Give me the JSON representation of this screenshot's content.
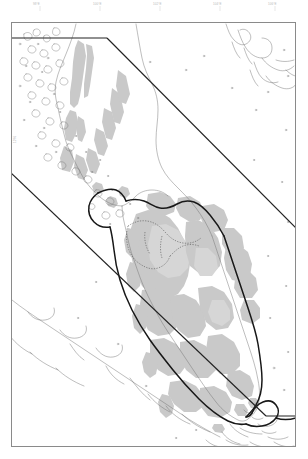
{
  "map": {
    "title": "Malay Peninsula Study Area Map",
    "region_name": "Malay Peninsula",
    "background_color": "#ffffff",
    "frame": {
      "border_color": "#8a8a8a",
      "x": 11,
      "y": 22,
      "width": 285,
      "height": 425
    },
    "legend_note": "",
    "graticule_color": "#c9c9c9",
    "top_tick_labels": [
      "98°E",
      "100°E",
      "102°E",
      "104°E",
      "106°E"
    ],
    "left_tick_labels": [
      "12°N",
      "8°N",
      "4°N"
    ],
    "layers": [
      {
        "name": "forest-cover",
        "label": "Forest / upland cover",
        "fill_color": "#c9c9c9",
        "stroke": "none"
      },
      {
        "name": "coastline",
        "label": "Coastline",
        "stroke_color": "#6e6e6e",
        "stroke_width": 0.45,
        "fill": "none"
      },
      {
        "name": "national-boundary",
        "label": "National boundary",
        "stroke_color": "#1a1a1a",
        "stroke_width": 1.5,
        "fill": "none"
      },
      {
        "name": "internal-boundary",
        "label": "Internal / provincial boundary",
        "stroke_color": "#555555",
        "stroke_width": 0.5,
        "dash": "1.2 1.2"
      },
      {
        "name": "study-area-polygon",
        "label": "Study area extent",
        "stroke_color": "#222222",
        "stroke_width": 1.1,
        "fill": "none"
      }
    ]
  }
}
